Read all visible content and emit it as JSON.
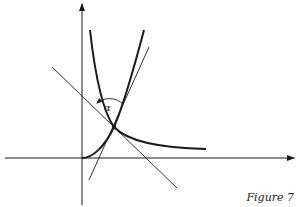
{
  "figure": {
    "caption": "Figure 7",
    "angle_label": "α",
    "colors": {
      "ink": "#1a1a1a",
      "background": "#ffffff"
    },
    "axes": {
      "x_axis": {
        "from": [
          5,
          158
        ],
        "to": [
          295,
          158
        ],
        "arrow": true
      },
      "y_axis": {
        "from": [
          82,
          205
        ],
        "to": [
          82,
          3
        ],
        "arrow": true
      }
    },
    "intersection_point": [
      114,
      127
    ],
    "curves": [
      {
        "name": "increasing-curve",
        "description": "rises from origin through intersection, steeply upward"
      },
      {
        "name": "decreasing-curve",
        "description": "falls steeply from top through intersection, levels off to the right"
      }
    ],
    "lines": [
      {
        "name": "tangent-line-decreasing",
        "from": [
          52,
          67
        ],
        "to": [
          177,
          188
        ]
      },
      {
        "name": "tangent-line-increasing",
        "from": [
          90,
          180
        ],
        "to": [
          148,
          48
        ]
      }
    ]
  }
}
